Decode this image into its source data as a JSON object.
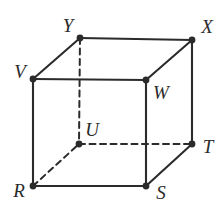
{
  "figure": {
    "type": "cube-diagram",
    "width": 224,
    "height": 204,
    "background_color": "#ffffff",
    "stroke_color": "#2b2b2b",
    "label_color": "#2b2b2b",
    "solid_stroke_width": 2.1,
    "dashed_stroke_width": 2.0,
    "dash_pattern": "6,4.5",
    "vertex_dot_radius": 3.4
  },
  "vertices": [
    {
      "id": "Y",
      "label": "Y",
      "x": 80,
      "y": 38,
      "hidden": false,
      "label_x": 68,
      "label_y": 25
    },
    {
      "id": "X",
      "label": "X",
      "x": 192,
      "y": 40,
      "hidden": false,
      "label_x": 207,
      "label_y": 26
    },
    {
      "id": "V",
      "label": "V",
      "x": 33,
      "y": 79,
      "hidden": false,
      "label_x": 20,
      "label_y": 71
    },
    {
      "id": "W",
      "label": "W",
      "x": 146,
      "y": 80,
      "hidden": false,
      "label_x": 161,
      "label_y": 92
    },
    {
      "id": "U",
      "label": "U",
      "x": 79,
      "y": 144,
      "hidden": true,
      "label_x": 92,
      "label_y": 129
    },
    {
      "id": "T",
      "label": "T",
      "x": 192,
      "y": 144,
      "hidden": false,
      "label_x": 208,
      "label_y": 146
    },
    {
      "id": "R",
      "label": "R",
      "x": 33,
      "y": 186,
      "hidden": false,
      "label_x": 19,
      "label_y": 190
    },
    {
      "id": "S",
      "label": "S",
      "x": 146,
      "y": 186,
      "hidden": false,
      "label_x": 161,
      "label_y": 192
    }
  ],
  "edges": [
    {
      "from": "V",
      "to": "W",
      "style": "solid",
      "name": "edge-v-w"
    },
    {
      "from": "W",
      "to": "S",
      "style": "solid",
      "name": "edge-w-s"
    },
    {
      "from": "S",
      "to": "R",
      "style": "solid",
      "name": "edge-s-r"
    },
    {
      "from": "R",
      "to": "V",
      "style": "solid",
      "name": "edge-r-v"
    },
    {
      "from": "Y",
      "to": "X",
      "style": "solid",
      "name": "edge-y-x"
    },
    {
      "from": "X",
      "to": "T",
      "style": "solid",
      "name": "edge-x-t"
    },
    {
      "from": "V",
      "to": "Y",
      "style": "solid",
      "name": "edge-v-y"
    },
    {
      "from": "W",
      "to": "X",
      "style": "solid",
      "name": "edge-w-x"
    },
    {
      "from": "S",
      "to": "T",
      "style": "solid",
      "name": "edge-s-t"
    },
    {
      "from": "Y",
      "to": "U",
      "style": "dashed",
      "name": "edge-y-u"
    },
    {
      "from": "U",
      "to": "T",
      "style": "dashed",
      "name": "edge-u-t"
    },
    {
      "from": "R",
      "to": "U",
      "style": "dashed",
      "name": "edge-r-u"
    }
  ]
}
